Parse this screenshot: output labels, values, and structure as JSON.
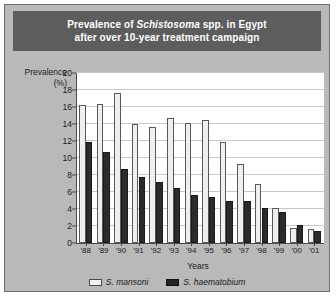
{
  "chart_data": {
    "type": "bar",
    "title_lines": [
      "Prevalence of Schistosoma spp. in Egypt",
      "after over 10-year treatment campaign"
    ],
    "title_italic_word": "Schistosoma",
    "title_prefix": "Prevalence of ",
    "title_suffix": " spp. in Egypt",
    "xlabel": "Years",
    "ylabel_line1": "Prevalence",
    "ylabel_line2": "(%)",
    "categories": [
      "'88",
      "'89",
      "'90",
      "'91",
      "'92",
      "'93",
      "'94",
      "'95",
      "'96",
      "'97",
      "'98",
      "'99",
      "'00",
      "'01"
    ],
    "ylim": [
      0,
      20
    ],
    "yticks": [
      0,
      2,
      4,
      6,
      8,
      10,
      12,
      14,
      16,
      18,
      20
    ],
    "grid": true,
    "legend_position": "bottom-center",
    "series": [
      {
        "name": "S. mansoni",
        "color": "#efefef",
        "values": [
          16.2,
          16.4,
          17.7,
          14.0,
          13.6,
          14.7,
          14.1,
          14.5,
          11.9,
          9.3,
          6.9,
          4.1,
          1.8,
          1.6
        ]
      },
      {
        "name": "S. haematobium",
        "color": "#2b2b2b",
        "values": [
          11.9,
          10.7,
          8.7,
          7.8,
          7.2,
          6.5,
          5.6,
          5.4,
          5.0,
          4.9,
          4.1,
          3.7,
          2.1,
          1.4
        ]
      }
    ]
  },
  "colors": {
    "panel": "#b9b9b9",
    "title_bar": "#5d5d5d",
    "title_text": "#ffffff",
    "plot_bg": "#ffffff",
    "gridline": "#c8c8c8",
    "axis": "#4a4a4a"
  }
}
